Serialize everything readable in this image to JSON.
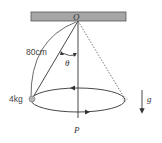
{
  "diagram": {
    "labels": {
      "pivot": "O",
      "length": "80cm",
      "angle": "θ",
      "mass": "4kg",
      "axis_point": "P",
      "gravity": "g"
    },
    "colors": {
      "ceiling_fill": "#a6a6a6",
      "ceiling_stroke": "#555555",
      "line": "#333333",
      "mass_fill": "#b5b5b5"
    }
  }
}
